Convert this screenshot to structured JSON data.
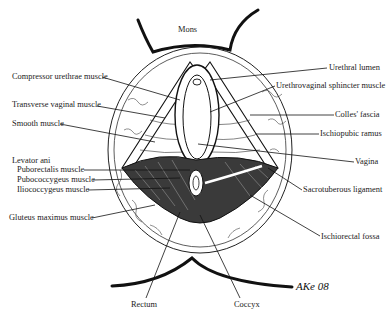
{
  "figure": {
    "signature": "AKe 08"
  },
  "labels": {
    "mons": "Mons",
    "left": [
      {
        "id": "compressor",
        "text": "Compressor urethrae muscle"
      },
      {
        "id": "transverse",
        "text": "Transverse vaginal muscle"
      },
      {
        "id": "smooth",
        "text": "Smooth muscle"
      },
      {
        "id": "levator",
        "text": "Levator ani"
      },
      {
        "id": "puborectalis",
        "text": "Puborectalis muscle"
      },
      {
        "id": "pubococcygeus",
        "text": "Pubococcygeus muscle"
      },
      {
        "id": "iliococcygeus",
        "text": "Iliococcygeus muscle"
      },
      {
        "id": "gluteus",
        "text": "Gluteus maximus muscle"
      }
    ],
    "right": [
      {
        "id": "urethral_lumen",
        "text": "Urethral lumen"
      },
      {
        "id": "urethrovaginal",
        "text": "Urethrovaginal sphincter muscle"
      },
      {
        "id": "colles",
        "text": "Colles' fascia"
      },
      {
        "id": "ischiopubic",
        "text": "Ischiopubic ramus"
      },
      {
        "id": "vagina",
        "text": "Vagina"
      },
      {
        "id": "sacrotuberous",
        "text": "Sacrotuberous ligament"
      },
      {
        "id": "ischiorectal",
        "text": "Ischiorectal fossa"
      }
    ],
    "bottom": [
      {
        "id": "rectum",
        "text": "Rectum"
      },
      {
        "id": "coccyx",
        "text": "Coccyx"
      }
    ]
  },
  "colors": {
    "ink": "#111111",
    "paper": "#ffffff"
  }
}
